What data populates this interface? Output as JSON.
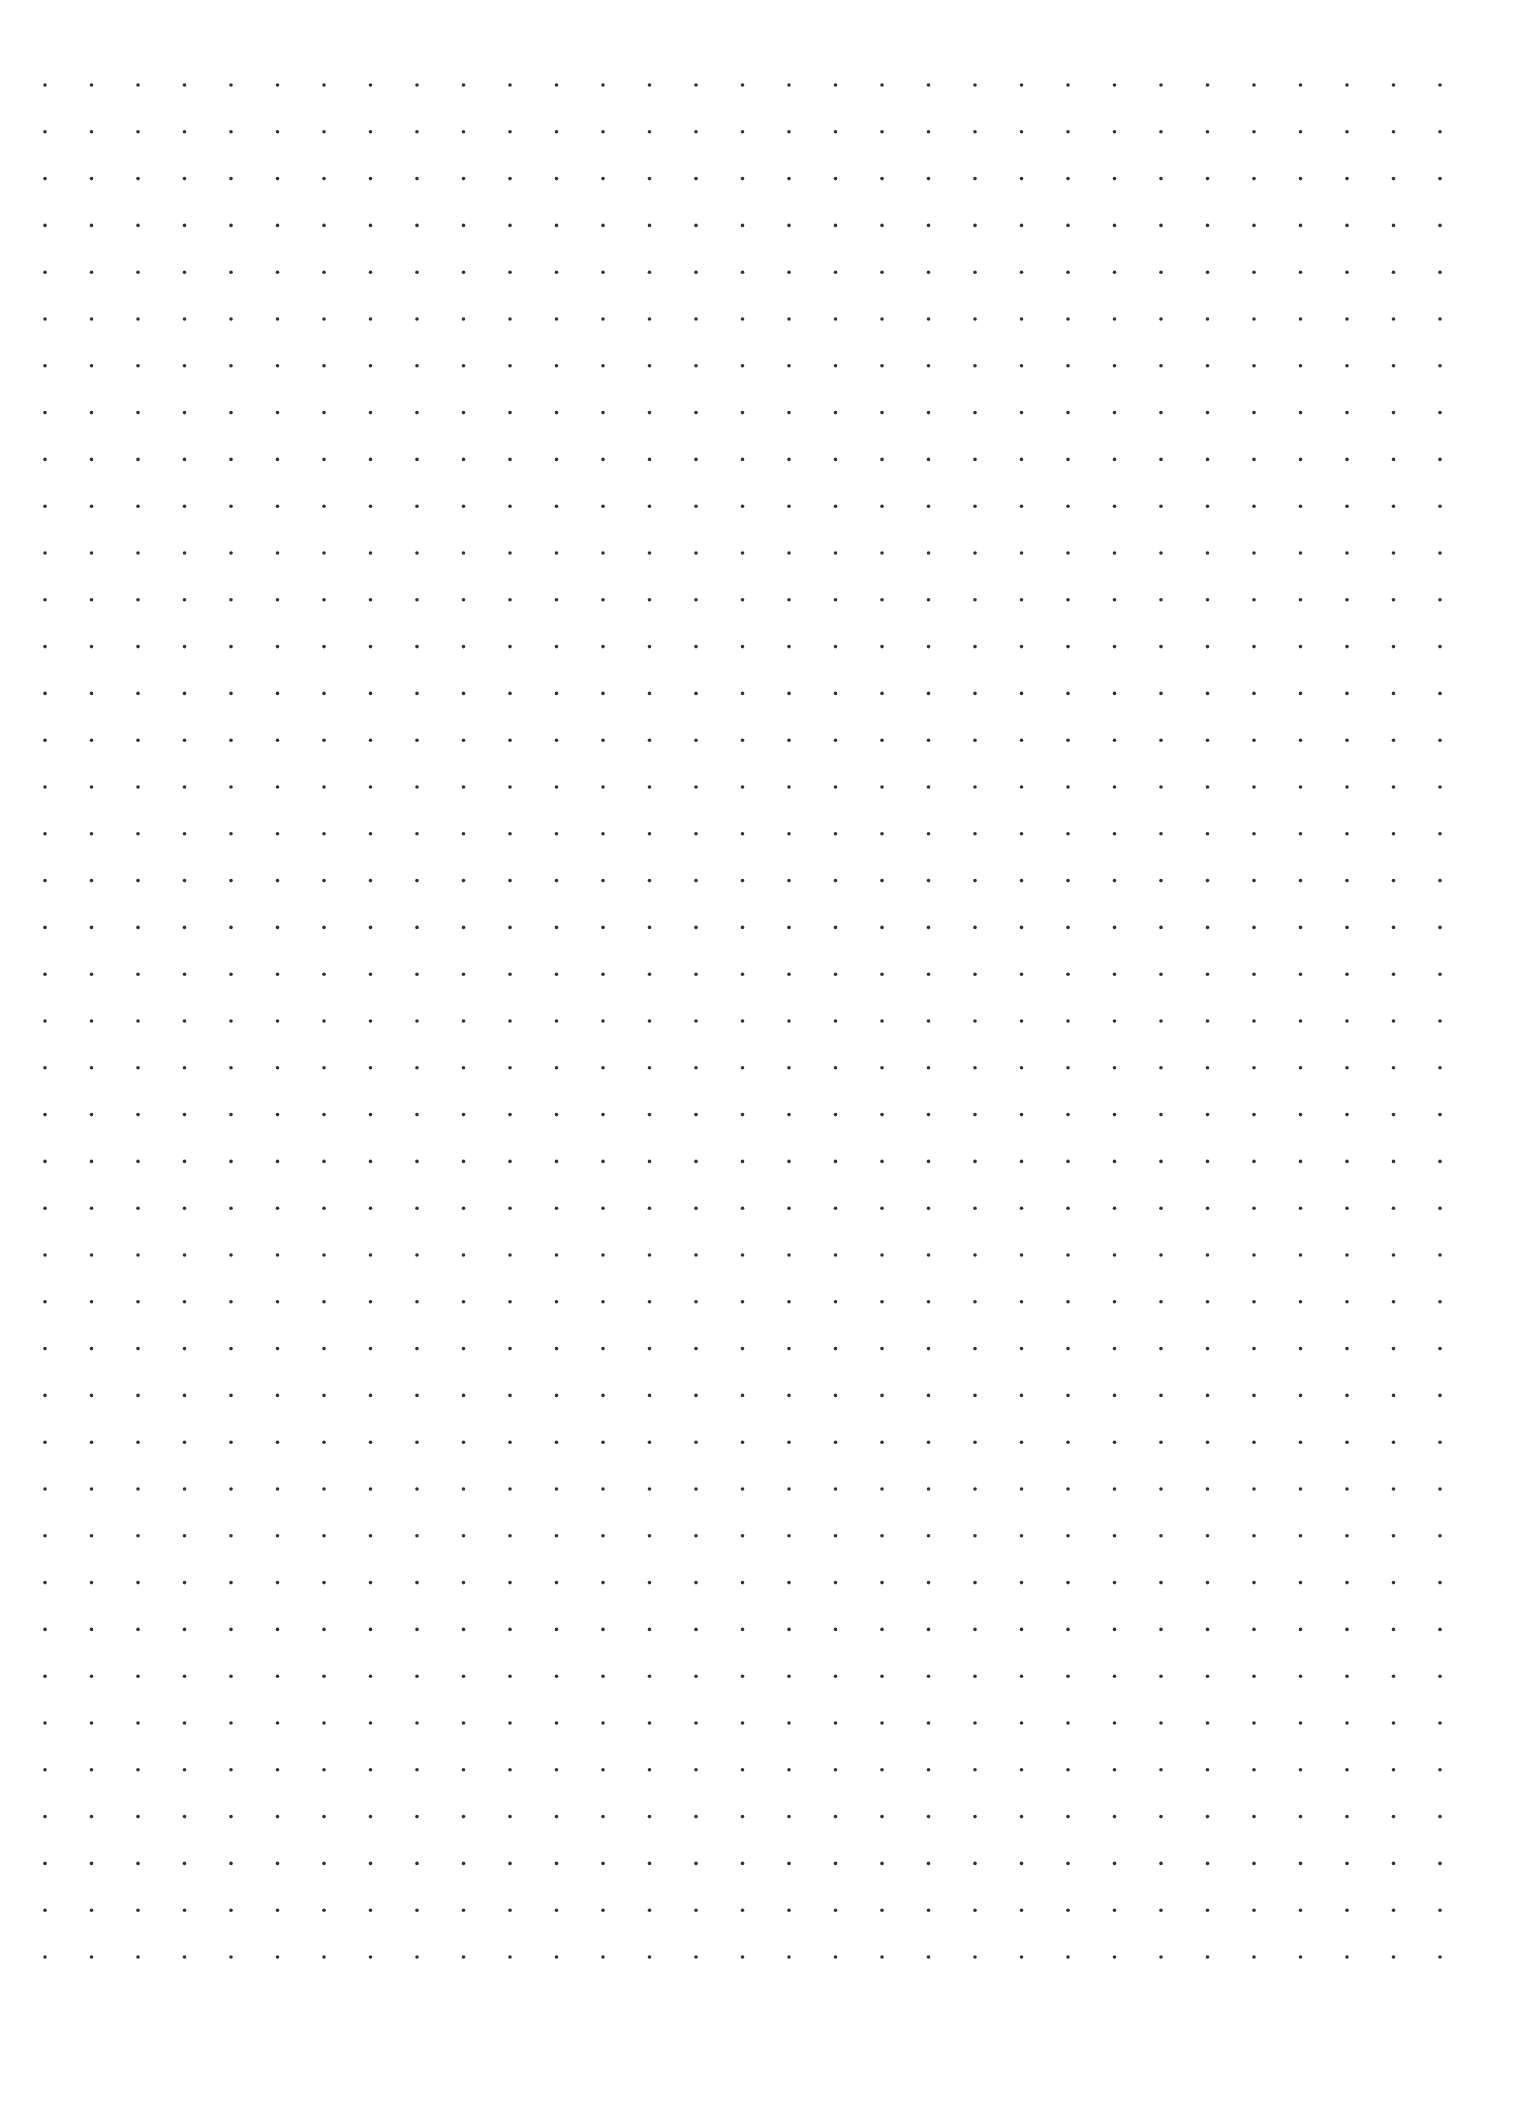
{
  "page": {
    "type": "dot-grid-paper",
    "background_color": "#ffffff",
    "dot_color": "#333333"
  },
  "grid": {
    "columns": 31,
    "rows": 41,
    "origin_x": 45,
    "origin_y": 85,
    "spacing_x": 46.5,
    "spacing_y": 46.8,
    "dot_radius": 1.8
  }
}
